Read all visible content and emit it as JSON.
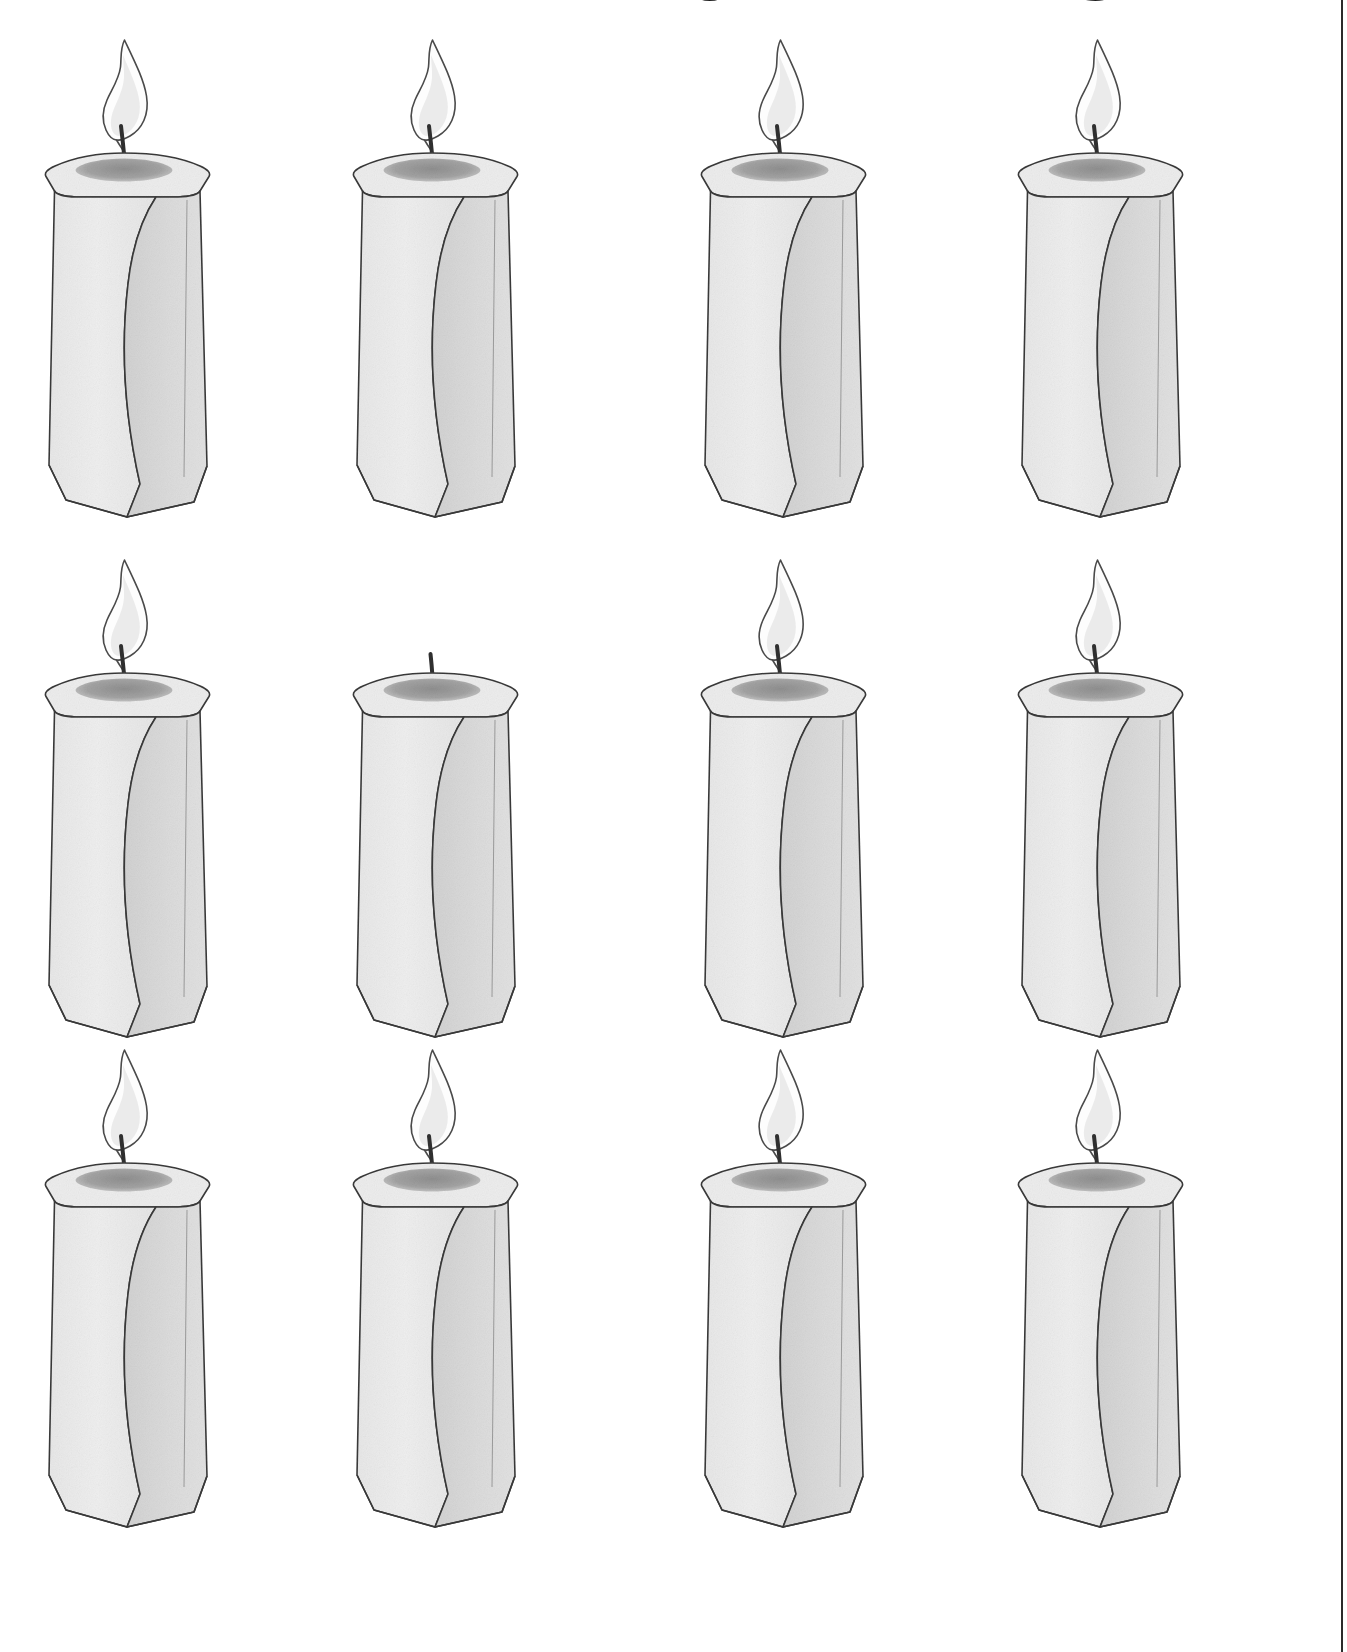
{
  "page": {
    "title": "DIFFERENT FROM THE REST",
    "background_color": "#ffffff",
    "frame_rule_color": "#2b2b2b",
    "width": 1347,
    "height": 1652
  },
  "puzzle": {
    "type": "odd-one-out",
    "subject": "candle",
    "rows": 3,
    "columns": 4,
    "total_items": 12,
    "odd_one_out_index": 5,
    "odd_one_out_position": "row 2, column 2",
    "odd_one_out_difference": "unlit — wick only, no flame"
  },
  "palette": {
    "outline": "#3a3a3a",
    "wax_light_face": "#efefef",
    "wax_dark_face": "#dcdcdc",
    "wax_top_face": "#ededed",
    "melt_pool": "#a3a3a3",
    "wick": "#2f2f2f",
    "flame_fill": "#fdfdfd",
    "flame_inner": "#dcdcdc",
    "flame_outline": "#4a4a4a"
  },
  "candles": [
    {
      "id": "candle-r1c1",
      "row": 1,
      "column": 1,
      "lit": true,
      "state_label": "lit"
    },
    {
      "id": "candle-r1c2",
      "row": 1,
      "column": 2,
      "lit": true,
      "state_label": "lit"
    },
    {
      "id": "candle-r1c3",
      "row": 1,
      "column": 3,
      "lit": true,
      "state_label": "lit"
    },
    {
      "id": "candle-r1c4",
      "row": 1,
      "column": 4,
      "lit": true,
      "state_label": "lit"
    },
    {
      "id": "candle-r2c1",
      "row": 2,
      "column": 1,
      "lit": true,
      "state_label": "lit"
    },
    {
      "id": "candle-r2c2",
      "row": 2,
      "column": 2,
      "lit": false,
      "state_label": "unlit"
    },
    {
      "id": "candle-r2c3",
      "row": 2,
      "column": 3,
      "lit": true,
      "state_label": "lit"
    },
    {
      "id": "candle-r2c4",
      "row": 2,
      "column": 4,
      "lit": true,
      "state_label": "lit"
    },
    {
      "id": "candle-r3c1",
      "row": 3,
      "column": 1,
      "lit": true,
      "state_label": "lit"
    },
    {
      "id": "candle-r3c2",
      "row": 3,
      "column": 2,
      "lit": true,
      "state_label": "lit"
    },
    {
      "id": "candle-r3c3",
      "row": 3,
      "column": 3,
      "lit": true,
      "state_label": "lit"
    },
    {
      "id": "candle-r3c4",
      "row": 3,
      "column": 4,
      "lit": true,
      "state_label": "lit"
    }
  ]
}
